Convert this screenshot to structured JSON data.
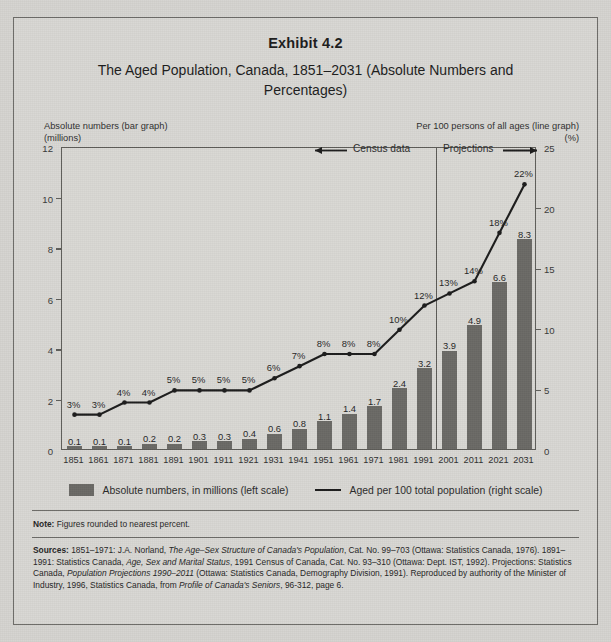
{
  "exhibit": {
    "title": "Exhibit 4.2",
    "subtitle": "The Aged Population, Canada, 1851–2031 (Absolute Numbers and Percentages)"
  },
  "axis_captions": {
    "left_line1": "Absolute numbers (bar graph)",
    "left_line2": "(millions)",
    "right_line1": "Per 100 persons of all ages (line graph)",
    "right_line2": "(%)"
  },
  "annotations": {
    "census": "Census data",
    "projections": "Projections",
    "divider_between": "1991 / 2001"
  },
  "legend": {
    "bar_label": "Absolute numbers, in millions (left scale)",
    "line_label": "Aged per 100 total population (right scale)",
    "bar_color": "#6b6a66",
    "line_color": "#1d1d1d"
  },
  "note": {
    "label": "Note:",
    "text": "Figures rounded to nearest percent."
  },
  "sources": {
    "label": "Sources:",
    "part1": "1851–1971: J.A. Norland, ",
    "italic1": "The Age–Sex Structure of Canada's Population",
    "part2": ", Cat. No. 99–703 (Ottawa: Statistics Canada, 1976). 1891–1991: Statistics Canada, ",
    "italic2": "Age, Sex and Marital Status",
    "part3": ", 1991 Census of Canada, Cat. No. 93–310 (Ottawa: Dept. IST, 1992). Projections: Statistics Canada, ",
    "italic3": "Population Projections 1990–2011",
    "part4": " (Ottawa: Statistics Canada, Demography Division, 1991). Reproduced by authority of the Minister of Industry, 1996, Statistics Canada, from ",
    "italic4": "Profile of Canada's Seniors",
    "part5": ", 96-312, page 6."
  },
  "chart_data": {
    "type": "bar",
    "title": "The Aged Population, Canada, 1851–2031 (Absolute Numbers and Percentages)",
    "xlabel": "",
    "ylabel": "Absolute numbers (bar graph) (millions)",
    "y2label": "Per 100 persons of all ages (line graph) (%)",
    "ylim": [
      0,
      12
    ],
    "y2lim": [
      0,
      25
    ],
    "yticks": [
      0,
      2,
      4,
      6,
      8,
      10,
      12
    ],
    "y2ticks": [
      0,
      5,
      10,
      15,
      20,
      25
    ],
    "grid": false,
    "legend_position": "below",
    "categories": [
      "1851",
      "1861",
      "1871",
      "1881",
      "1891",
      "1901",
      "1911",
      "1921",
      "1931",
      "1941",
      "1951",
      "1961",
      "1971",
      "1981",
      "1991",
      "2001",
      "2011",
      "2021",
      "2031"
    ],
    "series": [
      {
        "name": "Absolute numbers, in millions (left scale)",
        "type": "bar",
        "axis": "left",
        "color": "#6b6a66",
        "values": [
          0.1,
          0.1,
          0.1,
          0.2,
          0.2,
          0.3,
          0.3,
          0.4,
          0.6,
          0.8,
          1.1,
          1.4,
          1.7,
          2.4,
          3.2,
          3.9,
          4.9,
          6.6,
          8.3
        ],
        "labels": [
          "0.1",
          "0.1",
          "0.1",
          "0.2",
          "0.2",
          "0.3",
          "0.3",
          "0.4",
          "0.6",
          "0.8",
          "1.1",
          "1.4",
          "1.7",
          "2.4",
          "3.2",
          "3.9",
          "4.9",
          "6.6",
          "8.3"
        ]
      },
      {
        "name": "Aged per 100 total population (right scale)",
        "type": "line",
        "axis": "right",
        "color": "#1d1d1d",
        "values": [
          3,
          3,
          4,
          4,
          5,
          5,
          5,
          5,
          6,
          7,
          8,
          8,
          8,
          10,
          12,
          13,
          14,
          18,
          22
        ],
        "labels": [
          "3%",
          "3%",
          "4%",
          "4%",
          "5%",
          "5%",
          "5%",
          "5%",
          "6%",
          "7%",
          "8%",
          "8%",
          "8%",
          "10%",
          "12%",
          "13%",
          "14%",
          "18%",
          "22%"
        ]
      }
    ],
    "annotations": [
      {
        "text": "Census data",
        "span": "1851–1991"
      },
      {
        "text": "Projections",
        "span": "2001–2031"
      }
    ]
  }
}
